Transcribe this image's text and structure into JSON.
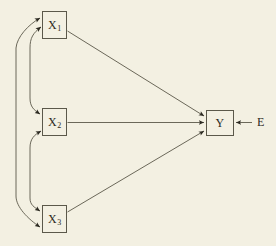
{
  "diagram": {
    "background_color": "#f3f0e2",
    "stroke_color": "#5b584a",
    "text_color": "#2c2a22",
    "nodes": [
      {
        "id": "x1",
        "label": "X",
        "subscript": "1",
        "x": 42,
        "y": 11,
        "w": 25,
        "h": 28
      },
      {
        "id": "x2",
        "label": "X",
        "subscript": "2",
        "x": 42,
        "y": 108,
        "w": 25,
        "h": 28
      },
      {
        "id": "x3",
        "label": "X",
        "subscript": "3",
        "x": 42,
        "y": 205,
        "w": 25,
        "h": 28
      },
      {
        "id": "y",
        "label": "Y",
        "subscript": "",
        "x": 206,
        "y": 110,
        "w": 28,
        "h": 26
      }
    ],
    "free_labels": [
      {
        "id": "e",
        "label": "E",
        "x": 257,
        "y": 116
      }
    ],
    "edges": [
      {
        "id": "x1-to-y",
        "from": "X1",
        "to": "Y",
        "style": "straight",
        "arrow": "single"
      },
      {
        "id": "x2-to-y",
        "from": "X2",
        "to": "Y",
        "style": "straight",
        "arrow": "single"
      },
      {
        "id": "x3-to-y",
        "from": "X3",
        "to": "Y",
        "style": "straight",
        "arrow": "single"
      },
      {
        "id": "e-to-y",
        "from": "E",
        "to": "Y",
        "style": "straight",
        "arrow": "single"
      },
      {
        "id": "x1-x2-covariance",
        "from": "X1",
        "to": "X2",
        "style": "curved-left",
        "arrow": "double"
      },
      {
        "id": "x2-x3-covariance",
        "from": "X2",
        "to": "X3",
        "style": "curved-left",
        "arrow": "double"
      },
      {
        "id": "x1-x3-covariance",
        "from": "X1",
        "to": "X3",
        "style": "curved-left-outer",
        "arrow": "double"
      }
    ]
  }
}
